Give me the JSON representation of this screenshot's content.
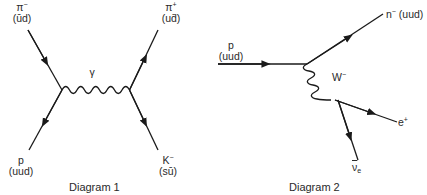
{
  "diagram1": {
    "caption": "Diagram 1",
    "exchange_boson": "γ",
    "particles": {
      "top_left": {
        "name": "π",
        "charge": "−",
        "quarks_open": "(",
        "q1": "ū",
        "q2": "d",
        "quarks_close": ")"
      },
      "top_right": {
        "name": "π",
        "charge": "+",
        "quarks_open": "(u",
        "q2": "d̄",
        "quarks_close": ")"
      },
      "bottom_left": {
        "name": "p",
        "quarks": "(uud)"
      },
      "bottom_right": {
        "name": "K",
        "charge": "−",
        "quarks_open": "(s",
        "q2": "ū",
        "quarks_close": ")"
      }
    }
  },
  "diagram2": {
    "caption": "Diagram 2",
    "exchange_boson": "W",
    "exchange_charge": "−",
    "particles": {
      "incoming": {
        "name": "p",
        "quarks": "(uud)"
      },
      "outgoing_top": {
        "name": "n",
        "charge": "−",
        "quarks": "(uud)"
      },
      "outgoing_right": {
        "name": "e",
        "charge": "+"
      },
      "outgoing_bottom": {
        "name": "ν",
        "subscript": "e"
      }
    }
  },
  "colors": {
    "line": "#1a1a1a",
    "text": "#2a2a2a",
    "background": "#ffffff"
  }
}
